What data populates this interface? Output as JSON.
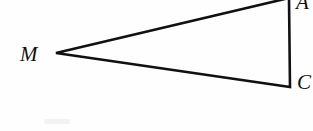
{
  "figure": {
    "name": "triangle-diagram",
    "background_color": "#fefefe",
    "stroke_color": "#111111",
    "stroke_width": 2.6,
    "width": 313,
    "height": 131
  },
  "labels": {
    "left_vertex": "M",
    "top_right_vertex": "A",
    "bottom_right_vertex": "C"
  },
  "geometry": {
    "type": "triangle",
    "description": "Thin elongated triangle with apex at left vertex M and a vertical right side joining the top-right and bottom-right vertices, both clipped by the image edge.",
    "vertices": [
      {
        "label": "M",
        "x": 56,
        "y": 53
      },
      {
        "label": "A",
        "x": 289,
        "y": -2
      },
      {
        "label": "C",
        "x": 290,
        "y": 87
      }
    ],
    "edges": [
      {
        "from": "M",
        "to": "A"
      },
      {
        "from": "A",
        "to": "C"
      },
      {
        "from": "C",
        "to": "M"
      }
    ]
  }
}
